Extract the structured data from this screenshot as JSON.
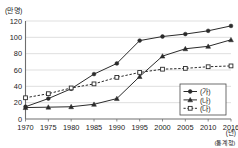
{
  "chart_data": {
    "type": "line",
    "title": "",
    "subtitle": "",
    "ylabel": "(만 명)",
    "xlabel": "(년)",
    "source": "(통계청)",
    "grid": true,
    "legend_position": "bottom-right",
    "ylim": [
      0,
      120
    ],
    "yticks": [
      0,
      20,
      40,
      60,
      80,
      100,
      120
    ],
    "categories": [
      "1970",
      "1975",
      "1980",
      "1985",
      "1990",
      "1995",
      "2000",
      "2005",
      "2010",
      "2016"
    ],
    "series": [
      {
        "name": "(가)",
        "marker": "filled-circle",
        "linestyle": "solid",
        "color": "#2b2b2b",
        "values": [
          15,
          25,
          37,
          55,
          68,
          96,
          101,
          104,
          108,
          114
        ]
      },
      {
        "name": "(나)",
        "marker": "filled-triangle",
        "linestyle": "solid",
        "color": "#2b2b2b",
        "values": [
          14,
          14.5,
          15,
          18,
          25,
          52,
          77,
          86,
          89,
          97
        ]
      },
      {
        "name": "(다)",
        "marker": "open-square",
        "linestyle": "dashed",
        "color": "#2b2b2b",
        "values": [
          26,
          31,
          38,
          43,
          51,
          57,
          61,
          62,
          64,
          65
        ]
      }
    ]
  }
}
